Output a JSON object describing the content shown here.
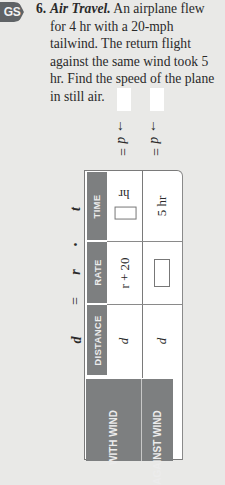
{
  "badge": {
    "label": "GS"
  },
  "problem": {
    "number": "6.",
    "title": "Air Travel.",
    "text": "An airplane flew for 4 hr with a 20-mph tailwind. The return flight against the same wind took 5 hr. Find the speed of the plane in still air."
  },
  "answers": [
    {
      "label": "→ d =",
      "value": ""
    },
    {
      "label": "→ d =",
      "value": ""
    }
  ],
  "formula": {
    "d": "d",
    "eq": "=",
    "r": "r",
    "dot": "•",
    "t": "t"
  },
  "table": {
    "column_headers": {
      "distance": "DISTANCE",
      "rate": "RATE",
      "time": "TIME"
    },
    "rows": [
      {
        "label": "WITH WIND",
        "distance": "d",
        "rate": "r + 20",
        "time_unit": "hr",
        "time_value": ""
      },
      {
        "label": "AGAINST WIND",
        "distance": "d",
        "rate_value": "",
        "time": "5 hr"
      }
    ]
  },
  "colors": {
    "header_bg": "#7d7f80",
    "page_bg": "#e9e9e7",
    "badge_bg": "#5f6366"
  }
}
